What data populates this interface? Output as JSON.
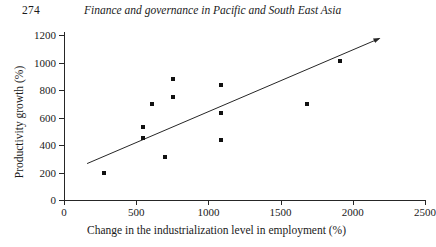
{
  "running_head": {
    "page_number": "274",
    "title": "Finance and governance in Pacific and South East Asia"
  },
  "chart_data": {
    "type": "scatter",
    "title": "",
    "xlabel": "Change in the industrialization level in employment (%)",
    "ylabel": "Productivity growth (%)",
    "xlim": [
      0,
      2500
    ],
    "ylim": [
      0,
      1200
    ],
    "xticks": [
      0,
      500,
      1000,
      1500,
      2000,
      2500
    ],
    "yticks": [
      0,
      200,
      400,
      600,
      800,
      1000,
      1200
    ],
    "xtick_labels": [
      "0",
      "500",
      "1000",
      "1500",
      "2000",
      "2500"
    ],
    "ytick_labels": [
      "0",
      "200",
      "400",
      "600",
      "800",
      "1000",
      "1200"
    ],
    "grid": false,
    "legend": "none",
    "marker": "filled-square",
    "marker_color": "#111111",
    "points": [
      {
        "x": 280,
        "y": 200
      },
      {
        "x": 550,
        "y": 530
      },
      {
        "x": 550,
        "y": 450
      },
      {
        "x": 610,
        "y": 700
      },
      {
        "x": 700,
        "y": 310
      },
      {
        "x": 755,
        "y": 880
      },
      {
        "x": 755,
        "y": 750
      },
      {
        "x": 1090,
        "y": 840
      },
      {
        "x": 1090,
        "y": 635
      },
      {
        "x": 1090,
        "y": 440
      },
      {
        "x": 1680,
        "y": 700
      },
      {
        "x": 1910,
        "y": 1010
      }
    ],
    "trendline": {
      "type": "linear-arrow",
      "x_start": 160,
      "y_start": 265,
      "x_end": 2185,
      "y_end": 1175,
      "color": "#262626",
      "arrowhead": "end"
    }
  }
}
